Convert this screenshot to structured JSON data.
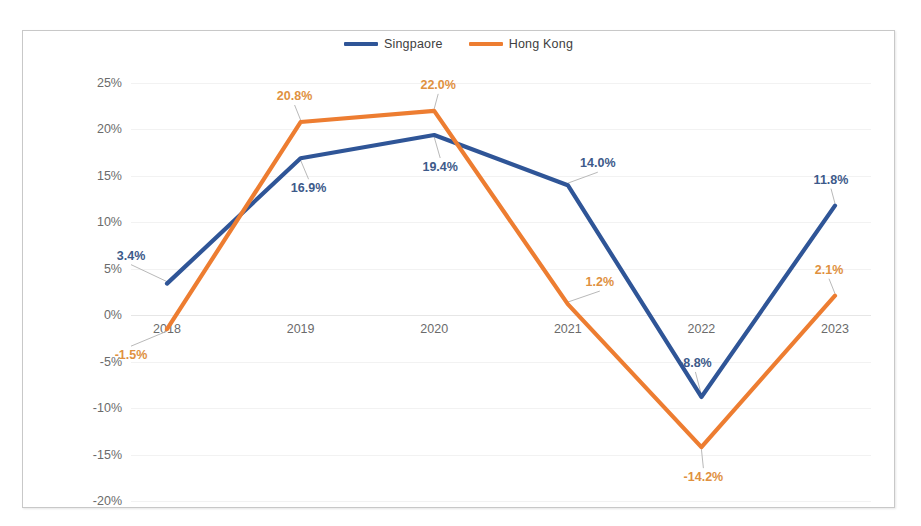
{
  "legend": {
    "position": "top-center",
    "entries": [
      {
        "label": "Singpaore",
        "color": "#2F5597"
      },
      {
        "label": "Hong Kong",
        "color": "#ED7D31"
      }
    ]
  },
  "axes": {
    "y_ticks": [
      "25%",
      "20%",
      "15%",
      "10%",
      "5%",
      "0%",
      "-5%",
      "-10%",
      "-15%",
      "-20%"
    ],
    "x_ticks": [
      "2018",
      "2019",
      "2020",
      "2021",
      "2022",
      "2023"
    ]
  },
  "caption": {
    "bottom_cutoff_text": ""
  },
  "chart_data": {
    "type": "line",
    "title": "",
    "subtitle": "",
    "xlabel": "",
    "ylabel": "",
    "categories": [
      "2018",
      "2019",
      "2020",
      "2021",
      "2022",
      "2023"
    ],
    "ylim": [
      -20,
      25
    ],
    "ytick_step": 5,
    "grid": true,
    "legend_position": "top-center",
    "series": [
      {
        "name": "Singpaore",
        "color": "#2F5597",
        "values": [
          3.4,
          16.9,
          19.4,
          14.0,
          -8.8,
          11.8
        ],
        "labels": [
          "3.4%",
          "16.9%",
          "19.4%",
          "14.0%",
          "-8.8%",
          "11.8%"
        ]
      },
      {
        "name": "Hong Kong",
        "color": "#ED7D31",
        "values": [
          -1.5,
          20.8,
          22.0,
          1.2,
          -14.2,
          2.1
        ],
        "labels": [
          "-1.5%",
          "20.8%",
          "22.0%",
          "1.2%",
          "-14.2%",
          "2.1%"
        ]
      }
    ],
    "label_offsets": {
      "Singpaore": [
        {
          "dx": -36,
          "dy": -28
        },
        {
          "dx": 8,
          "dy": 30
        },
        {
          "dx": 6,
          "dy": 32
        },
        {
          "dx": 30,
          "dy": -22
        },
        {
          "dx": -6,
          "dy": -34
        },
        {
          "dx": -4,
          "dy": -26
        }
      ],
      "Hong Kong": [
        {
          "dx": -36,
          "dy": 26
        },
        {
          "dx": -6,
          "dy": -26
        },
        {
          "dx": 4,
          "dy": -26
        },
        {
          "dx": 32,
          "dy": -22
        },
        {
          "dx": 2,
          "dy": 30
        },
        {
          "dx": -6,
          "dy": -26
        }
      ]
    }
  }
}
